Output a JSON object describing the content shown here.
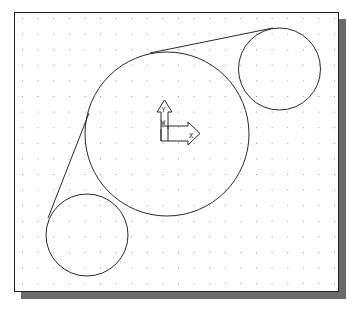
{
  "canvas": {
    "background": "#ffffff",
    "frame_color": "#222222",
    "shadow_color": "#6b6b6b",
    "grid": {
      "spacing": 15.6,
      "origin_x": 22,
      "origin_y": 18,
      "dot_color": "#9a9a9a"
    }
  },
  "geometry": {
    "stroke_color": "#2a2a2a",
    "circles": [
      {
        "name": "large-circle",
        "cx": 167,
        "cy": 134,
        "r": 82
      },
      {
        "name": "top-right-circle",
        "cx": 279.5,
        "cy": 69,
        "r": 41
      },
      {
        "name": "bottom-left-circle",
        "cx": 87,
        "cy": 235,
        "r": 41
      }
    ],
    "lines": [
      {
        "name": "top-tangent-line",
        "x1": 150,
        "y1": 53,
        "x2": 273,
        "y2": 28
      },
      {
        "name": "left-tangent-line",
        "x1": 89,
        "y1": 113,
        "x2": 48,
        "y2": 218
      }
    ]
  },
  "ucs_icon": {
    "x_label": "X",
    "y_label": "Y",
    "w_label": "W"
  }
}
